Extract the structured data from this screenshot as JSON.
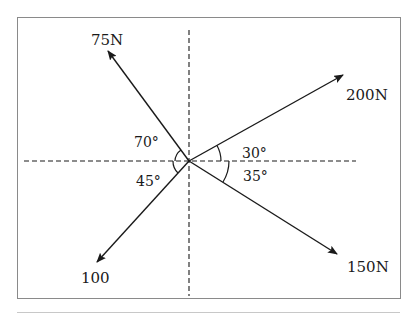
{
  "diagram": {
    "type": "force-diagram",
    "colors": {
      "line": "#1a1a1a",
      "frame": "#8a8a8a",
      "background": "#ffffff"
    },
    "axes": {
      "horizontal": "dashed",
      "vertical": "dashed"
    },
    "forces": [
      {
        "id": "f1",
        "label": "75N",
        "angle_label": "70°",
        "direction": "upper-left"
      },
      {
        "id": "f2",
        "label": "200N",
        "angle_label": "30°",
        "direction": "upper-right"
      },
      {
        "id": "f3",
        "label": "150N",
        "angle_label": "35°",
        "direction": "lower-right"
      },
      {
        "id": "f4",
        "label": "100",
        "angle_label": "45°",
        "direction": "lower-left"
      }
    ]
  }
}
